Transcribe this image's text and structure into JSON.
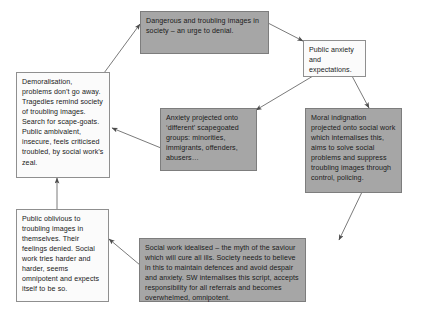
{
  "diagram": {
    "colors": {
      "gray_fill": "#a6a6a6",
      "white_fill": "#fbfbfb",
      "border": "#8a8a8a",
      "arrow": "#5a5a5a",
      "text": "#1a1a1a",
      "background": "#ffffff"
    },
    "nodes": [
      {
        "id": "dangerous-images",
        "label": "Dangerous and troubling images in society – an urge to denial.",
        "fill": "gray"
      },
      {
        "id": "public-anxiety",
        "label": "Public anxiety and expectations.",
        "fill": "white"
      },
      {
        "id": "moral-indignation",
        "label": "Moral indignation projected onto social work which internalises this, aims to solve social problems and suppress troubling images through control, policing.",
        "fill": "gray"
      },
      {
        "id": "social-work-idealised",
        "label": "Social work idealised – the myth of the saviour which will cure all ills. Society needs to believe in this to maintain defences and avoid despair and anxiety. SW internalises this script, accepts responsibility for all referrals and becomes overwhelmed, omnipotent.",
        "fill": "gray"
      },
      {
        "id": "public-oblivious",
        "label": "Public oblivious to troubling images in themselves. Their feelings denied. Social work tries harder and harder, seems omnipotent and expects itself to be so.",
        "fill": "white"
      },
      {
        "id": "demoralisation",
        "label": "Demoralisation, problems don’t go away. Tragedies remind society of troubling images. Search for scape-goats. Public ambivalent, insecure, feels criticised troubled, by social work’s zeal.",
        "fill": "white"
      },
      {
        "id": "anxiety-projected",
        "label": "Anxiety projected onto ‘different’ scapegoated groups: minorities, immigrants, offenders, abusers…",
        "fill": "gray"
      }
    ],
    "edges": [
      {
        "id": "edge-dangerous-to-public-anxiety",
        "from": "dangerous-images",
        "to": "public-anxiety"
      },
      {
        "id": "edge-public-anxiety-to-moral-indignation",
        "from": "public-anxiety",
        "to": "moral-indignation"
      },
      {
        "id": "edge-public-anxiety-to-anxiety-projected",
        "from": "public-anxiety",
        "to": "anxiety-projected"
      },
      {
        "id": "edge-moral-indignation-to-social-work-idealised",
        "from": "moral-indignation",
        "to": "social-work-idealised"
      },
      {
        "id": "edge-social-work-idealised-to-public-oblivious",
        "from": "social-work-idealised",
        "to": "public-oblivious"
      },
      {
        "id": "edge-public-oblivious-to-demoralisation",
        "from": "public-oblivious",
        "to": "demoralisation"
      },
      {
        "id": "edge-anxiety-projected-to-demoralisation",
        "from": "anxiety-projected",
        "to": "demoralisation"
      },
      {
        "id": "edge-demoralisation-to-dangerous",
        "from": "demoralisation",
        "to": "dangerous-images"
      }
    ]
  }
}
